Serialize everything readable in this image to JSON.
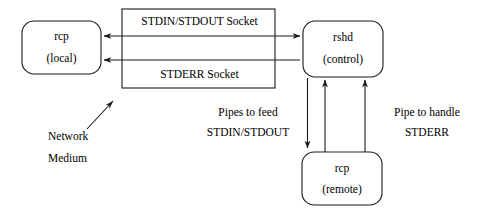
{
  "diagram": {
    "colors": {
      "stroke": "#1b1b1b",
      "background": "#ffffff",
      "text": "#000000"
    },
    "nodes": {
      "rcp_local": {
        "line1": "rcp",
        "line2": "(local)",
        "shape": "rounded-rectangle"
      },
      "rshd_control": {
        "line1": "rshd",
        "line2": "(control)",
        "shape": "rounded-rectangle"
      },
      "rcp_remote": {
        "line1": "rcp",
        "line2": "(remote)",
        "shape": "rounded-rectangle"
      }
    },
    "socket_box": {
      "top_label": "STDIN/STDOUT Socket",
      "bottom_label": "STDERR Socket",
      "shape": "rectangle"
    },
    "annotations": {
      "network_medium": {
        "line1": "Network",
        "line2": "Medium"
      },
      "pipes_feed": {
        "line1": "Pipes to feed",
        "line2": "STDIN/STDOUT"
      },
      "pipe_stderr": {
        "line1": "Pipe to handle",
        "line2": "STDERR"
      }
    },
    "connectors": {
      "stdin_stdout_socket": "bidirectional-arrow",
      "stderr_socket": "left-arrow",
      "pipe_down": "down-arrow",
      "pipe_up_1": "up-arrow",
      "pipe_up_2": "up-arrow",
      "network_pointer": "diagonal-arrow"
    }
  }
}
